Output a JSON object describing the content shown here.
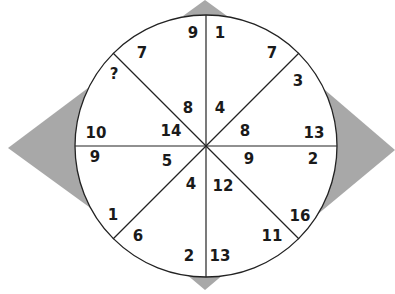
{
  "puzzle": {
    "colors": {
      "triangle": "#a8a8a8",
      "line": "#222222",
      "circle_fill": "#ffffff",
      "text": "#1a1a1a"
    },
    "segments": [
      {
        "id": "top-right",
        "outer": "1",
        "rim": "7",
        "inner": "4"
      },
      {
        "id": "right-upper",
        "outer": "3",
        "rim": "13",
        "inner": "8"
      },
      {
        "id": "right-lower",
        "outer": "2",
        "rim": "16",
        "inner": "9"
      },
      {
        "id": "bottom-right",
        "outer": "11",
        "rim": "13",
        "inner": "12"
      },
      {
        "id": "bottom-left",
        "outer": "2",
        "rim": "6",
        "inner": "4"
      },
      {
        "id": "left-lower",
        "outer": "9",
        "rim": "1",
        "inner": "5"
      },
      {
        "id": "left-upper",
        "outer": "10",
        "rim": "?",
        "inner": "14"
      },
      {
        "id": "top-left",
        "outer": "7",
        "rim": "9",
        "inner": "8"
      }
    ],
    "labels": [
      {
        "text": "9",
        "x": 193,
        "y": 33
      },
      {
        "text": "1",
        "x": 220,
        "y": 33
      },
      {
        "text": "7",
        "x": 142,
        "y": 53
      },
      {
        "text": "7",
        "x": 272,
        "y": 53
      },
      {
        "text": "?",
        "x": 114,
        "y": 74
      },
      {
        "text": "3",
        "x": 298,
        "y": 81
      },
      {
        "text": "8",
        "x": 188,
        "y": 108
      },
      {
        "text": "4",
        "x": 220,
        "y": 108
      },
      {
        "text": "10",
        "x": 96,
        "y": 133
      },
      {
        "text": "14",
        "x": 171,
        "y": 131
      },
      {
        "text": "8",
        "x": 245,
        "y": 131
      },
      {
        "text": "13",
        "x": 314,
        "y": 133
      },
      {
        "text": "9",
        "x": 95,
        "y": 157
      },
      {
        "text": "5",
        "x": 167,
        "y": 161
      },
      {
        "text": "9",
        "x": 249,
        "y": 159
      },
      {
        "text": "2",
        "x": 313,
        "y": 159
      },
      {
        "text": "4",
        "x": 191,
        "y": 184
      },
      {
        "text": "12",
        "x": 223,
        "y": 186
      },
      {
        "text": "1",
        "x": 113,
        "y": 215
      },
      {
        "text": "16",
        "x": 300,
        "y": 216
      },
      {
        "text": "6",
        "x": 138,
        "y": 236
      },
      {
        "text": "11",
        "x": 272,
        "y": 236
      },
      {
        "text": "2",
        "x": 189,
        "y": 256
      },
      {
        "text": "13",
        "x": 220,
        "y": 256
      }
    ]
  }
}
